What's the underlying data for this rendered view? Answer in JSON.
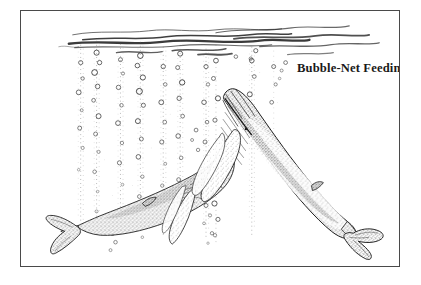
{
  "figure": {
    "title": "Bubble-Net Feeding",
    "medium": "pen-and-ink stipple drawing",
    "frame": {
      "border_color": "#4a4a4a",
      "background_color": "#fefefe"
    },
    "palette": {
      "ink": "#1a1a1a",
      "ink_mid": "#555555",
      "ink_light": "#8d8d8d",
      "paper": "#ffffff"
    },
    "scene": {
      "water_surface_label": "water-surface",
      "bubble_columns_count": 9,
      "whales": [
        {
          "name": "lower-left-whale",
          "species": "humpback whale",
          "orientation": "swimming up and to the right, fluke at lower left"
        },
        {
          "name": "right-whale",
          "species": "humpback whale",
          "orientation": "head up at upper left, body descending to lower right fluke"
        }
      ]
    }
  }
}
